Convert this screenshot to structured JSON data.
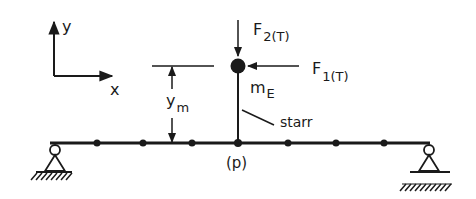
{
  "axes": {
    "y_label": "y",
    "x_label": "x"
  },
  "forces": {
    "vertical": {
      "symbol": "F",
      "subscript": "2(T)"
    },
    "horizontal": {
      "symbol": "F",
      "subscript": "1(T)"
    }
  },
  "dimension": {
    "symbol": "y",
    "subscript": "m"
  },
  "mass": {
    "symbol": "m",
    "subscript": "E"
  },
  "mast_label": "starr",
  "node_label": "(p)",
  "beam": {
    "nodes_x": [
      97,
      143,
      192,
      238,
      288,
      336,
      384
    ],
    "supports": [
      "pinned-roller-left",
      "pinned-roller-right"
    ]
  },
  "colors": {
    "ink": "#1a1a1a",
    "background": "#ffffff"
  }
}
